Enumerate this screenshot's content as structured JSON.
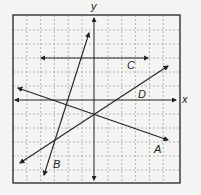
{
  "diagram": {
    "type": "coordinate-plane",
    "axes": {
      "x_label": "x",
      "y_label": "y"
    },
    "grid": {
      "cells_x": 12,
      "cells_y": 12,
      "style": "dashed"
    },
    "lines": [
      {
        "label": "A",
        "description": "line with negative slope through near origin-below point"
      },
      {
        "label": "B",
        "description": "steep line with positive slope"
      },
      {
        "label": "C",
        "description": "horizontal line above x-axis"
      },
      {
        "label": "D",
        "description": "line with positive slope"
      }
    ],
    "colors": {
      "line": "#222222",
      "grid": "#9a9a9a",
      "background": "#f4f4f2"
    }
  }
}
